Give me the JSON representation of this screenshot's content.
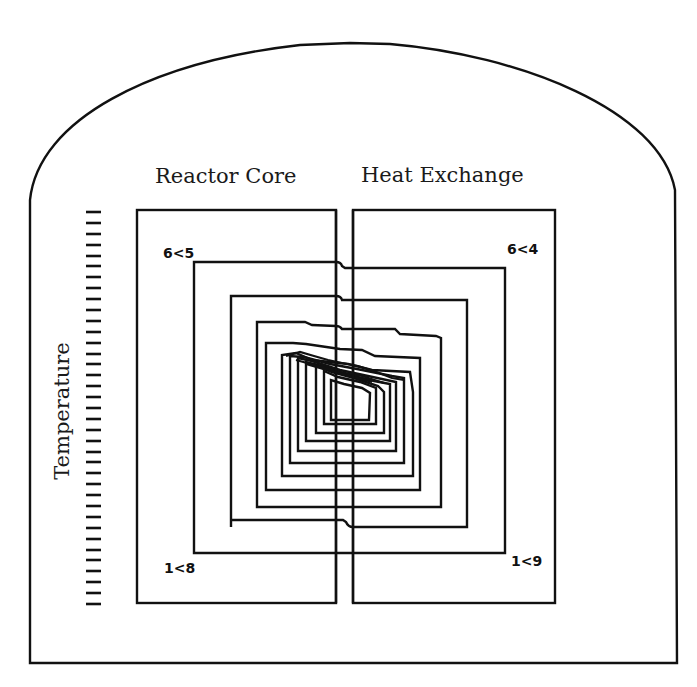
{
  "diagram": {
    "title_left": "Reactor Core",
    "title_right": "Heat Exchange",
    "axis_label": "Temperature",
    "corner_labels": {
      "top_left": "6<5",
      "top_right": "6<4",
      "bottom_left": "1<8",
      "bottom_right": "1<9"
    },
    "tick_count": 37,
    "colors": {
      "background": "#ffffff",
      "stroke": "#111111"
    }
  }
}
